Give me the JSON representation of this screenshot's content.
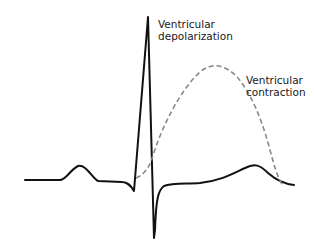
{
  "labels": {
    "depolarization_line1": "Ventricular",
    "depolarization_line2": "depolarization",
    "contraction_line1": "Ventricular",
    "contraction_line2": "contraction"
  },
  "colors": {
    "ecg_trace": "#111111",
    "contraction_curve": "#888888",
    "text": "#1a1a1a"
  }
}
